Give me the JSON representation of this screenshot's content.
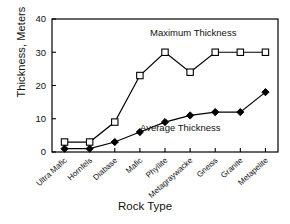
{
  "chart_data": {
    "type": "line",
    "title": "",
    "xlabel": "Rock Type",
    "ylabel": "Thickness, Meters",
    "categories": [
      "Ultra Mafic",
      "Hornfels",
      "Diabase",
      "Mafic",
      "Phyllite",
      "Metagraywacke",
      "Gneiss",
      "Granite",
      "Metapelite"
    ],
    "series": [
      {
        "name": "Maximum Thickness",
        "marker": "open-square",
        "color": "#000000",
        "values": [
          3,
          3,
          9,
          23,
          30,
          24,
          30,
          30,
          30
        ]
      },
      {
        "name": "Average Thickness",
        "marker": "filled-diamond",
        "color": "#000000",
        "values": [
          1,
          1,
          3,
          6,
          9,
          11,
          12,
          12,
          18
        ]
      }
    ],
    "ylim": [
      0,
      40
    ],
    "yticks": [
      0,
      10,
      20,
      30,
      40
    ],
    "ytick_labels": [
      "0",
      "10",
      "20",
      "30",
      "40"
    ],
    "grid": false,
    "legend": "inline-annotations",
    "annotations": [
      {
        "text": "Maximum Thickness",
        "series": "Maximum Thickness"
      },
      {
        "text": "Average Thickness",
        "series": "Average Thickness"
      }
    ]
  },
  "axes": {
    "y_title": "Thickness, Meters",
    "x_title": "Rock Type"
  }
}
